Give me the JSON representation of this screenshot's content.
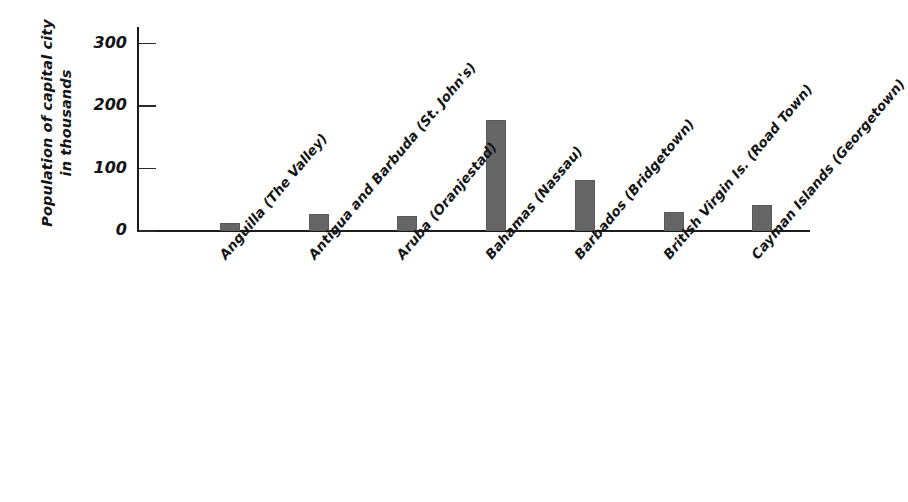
{
  "chart_data": {
    "type": "bar",
    "title": "",
    "xlabel": "",
    "ylabel": "Population of capital city in thousands",
    "ylabel_lines": [
      "Population of capital city",
      "in thousands"
    ],
    "ylim": [
      0,
      300
    ],
    "yticks": [
      0,
      100,
      200,
      300
    ],
    "ytick_labels": [
      "0",
      "100",
      "200",
      "300"
    ],
    "grid": false,
    "legend": null,
    "categories": [
      "Anguilla (The Valley)",
      "Antigua and Barbuda (St. John's)",
      "Aruba (Oranjestad)",
      "Bahamas (Nassau)",
      "Barbados (Bridgetown)",
      "British Virgin Is. (Road Town)",
      "Cayman Islands (Georgetown)"
    ],
    "values": [
      13,
      27,
      24,
      178,
      82,
      30,
      42
    ],
    "bar_color": "#666666",
    "axis_color": "#1c1c1c"
  }
}
